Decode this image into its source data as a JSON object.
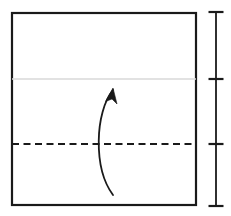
{
  "figure": {
    "kind": "origami-fold-diagram",
    "width": 231,
    "height": 216,
    "background": "#ffffff"
  },
  "colors": {
    "outline": "#1a1a1a",
    "crease_existing": "#d9d9d9",
    "crease_fold": "#1a1a1a",
    "arrow": "#1a1a1a",
    "scale_bar": "#1a1a1a"
  },
  "paper": {
    "label": "paper-sheet",
    "x": 12,
    "y": 13,
    "width": 184,
    "height": 192,
    "stroke_width": 2.2
  },
  "creases": [
    {
      "label": "existing-crease-line",
      "style": "solid",
      "color": "#d9d9d9",
      "y": 79,
      "x1": 12,
      "x2": 196,
      "stroke_width": 1.4
    },
    {
      "label": "valley-fold-line",
      "style": "dashed",
      "color": "#1a1a1a",
      "y": 144,
      "x1": 12,
      "x2": 196,
      "stroke_width": 2,
      "dash": "7 4.5"
    }
  ],
  "arrow": {
    "label": "fold-up-arrow",
    "direction": "upward",
    "tail": {
      "x": 113,
      "y": 195
    },
    "tip": {
      "x": 113,
      "y": 88
    },
    "control_1": {
      "x": 93,
      "y": 168
    },
    "control_2": {
      "x": 95,
      "y": 112
    },
    "head_angle_deg": 38,
    "stroke_width": 1.8,
    "path": "M 113 195 C 93 168 95 112 113 90",
    "head_path": "M 113 88 L 105.5 101.5 L 112 99 L 117 104 Z"
  },
  "scale_bar": {
    "label": "height-scale-bar",
    "x": 216,
    "y_top": 12,
    "y_bottom": 206,
    "stroke_width": 1.8,
    "tick_half_width": 7.5,
    "tick_stroke_width": 2.2,
    "ticks": [
      {
        "label": "tick-top",
        "y": 12
      },
      {
        "label": "tick-upper-crease",
        "y": 79
      },
      {
        "label": "tick-fold-line",
        "y": 144
      },
      {
        "label": "tick-bottom",
        "y": 206
      }
    ]
  }
}
